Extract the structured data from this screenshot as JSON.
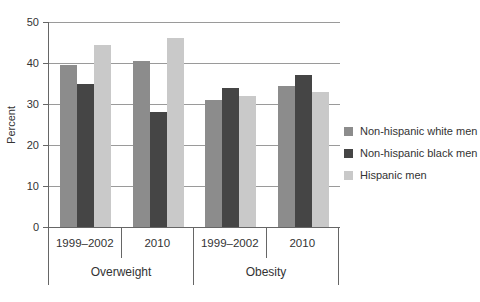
{
  "chart_data": {
    "type": "bar",
    "title": "",
    "ylabel": "Percent",
    "xlabel": "",
    "ylim": [
      0,
      50
    ],
    "yticks": [
      0,
      10,
      20,
      30,
      40,
      50
    ],
    "grid": "horizontal",
    "legend_position": "right",
    "group_labels": [
      "1999–2002",
      "2010",
      "1999–2002",
      "2010"
    ],
    "category_labels": [
      "Overweight",
      "Obesity"
    ],
    "series": [
      {
        "name": "Non-hispanic white men",
        "color": "#8c8c8c",
        "values": [
          39.5,
          40.5,
          31,
          34.5
        ]
      },
      {
        "name": "Non-hispanic black men",
        "color": "#454545",
        "values": [
          35,
          28,
          34,
          37
        ]
      },
      {
        "name": "Hispanic men",
        "color": "#c9c9c9",
        "values": [
          44.5,
          46,
          32,
          33
        ]
      }
    ]
  },
  "colors": {
    "axis": "#666666",
    "grid": "#9a9a9a",
    "text": "#333333",
    "background": "#ffffff"
  }
}
